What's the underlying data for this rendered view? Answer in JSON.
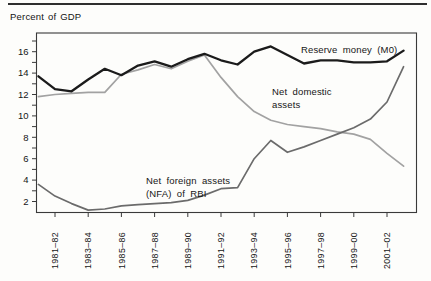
{
  "figure": {
    "axis_title": "Percent of GDP"
  },
  "chart_data": {
    "type": "line",
    "title": "",
    "xlabel": "",
    "ylabel": "Percent of GDP",
    "x_fiscal_years": [
      "1980–81",
      "1981–82",
      "1982–83",
      "1983–84",
      "1984–85",
      "1985–86",
      "1986–87",
      "1987–88",
      "1988–89",
      "1989–90",
      "1990–91",
      "1991–92",
      "1992–93",
      "1993–94",
      "1994–95",
      "1995–96",
      "1996–97",
      "1997–98",
      "1998–99",
      "1999–00",
      "2000–01",
      "2001–02",
      "2002–03"
    ],
    "x_tick_labels": [
      "1981–82",
      "1983–84",
      "1985–86",
      "1987–88",
      "1989–90",
      "1991–92",
      "1993–94",
      "1995–96",
      "1997–98",
      "1999–00",
      "2001–02"
    ],
    "y_tick_labels": [
      2,
      4,
      6,
      8,
      10,
      12,
      14,
      16
    ],
    "y_minor_tick_step": 1,
    "ylim": [
      1,
      17.75
    ],
    "grid": "off",
    "legend_position": "inline-annotations",
    "series": [
      {
        "name": "Reserve money (M0)",
        "color": "#1b1b1b",
        "stroke_width": 2.3,
        "values": [
          13.7,
          12.5,
          12.3,
          13.4,
          14.4,
          13.8,
          14.7,
          15.1,
          14.6,
          15.3,
          15.8,
          15.2,
          14.8,
          16.0,
          16.5,
          15.7,
          14.9,
          15.2,
          15.2,
          15.0,
          15.0,
          15.1,
          16.1
        ]
      },
      {
        "name": "Net domestic assets",
        "color": "#a2a2a2",
        "stroke_width": 1.7,
        "values": [
          11.8,
          12.0,
          12.1,
          12.2,
          12.2,
          13.9,
          14.3,
          14.8,
          14.4,
          15.1,
          15.7,
          13.6,
          11.8,
          10.4,
          9.6,
          9.2,
          9.0,
          8.8,
          8.5,
          8.3,
          7.8,
          6.5,
          5.3
        ]
      },
      {
        "name": "Net foreign assets (NFA) of RBI",
        "color": "#6b6b6b",
        "stroke_width": 1.7,
        "values": [
          3.6,
          2.5,
          1.8,
          1.2,
          1.3,
          1.6,
          1.7,
          1.8,
          1.9,
          2.1,
          2.6,
          3.2,
          3.3,
          6.0,
          7.7,
          6.6,
          7.1,
          7.7,
          8.3,
          8.9,
          9.7,
          11.3,
          14.6
        ]
      }
    ],
    "annotations": [
      {
        "id": "label-reserve-money",
        "text": "Reserve money (M0)",
        "x": 301,
        "y": 53
      },
      {
        "id": "label-net-domestic-1",
        "text": "Net domestic",
        "x": 272,
        "y": 95
      },
      {
        "id": "label-net-domestic-2",
        "text": "assets",
        "x": 272,
        "y": 108
      },
      {
        "id": "label-nfa-1",
        "text": "Net foreign assets",
        "x": 146,
        "y": 184
      },
      {
        "id": "label-nfa-2",
        "text": "(NFA) of RBI",
        "x": 146,
        "y": 197
      }
    ],
    "colors": {
      "frame": "#3a3a3a",
      "tick": "#3a3a3a",
      "text": "#161616",
      "top_rule": "#2e2e2e",
      "background": "#fdfdfb"
    }
  }
}
